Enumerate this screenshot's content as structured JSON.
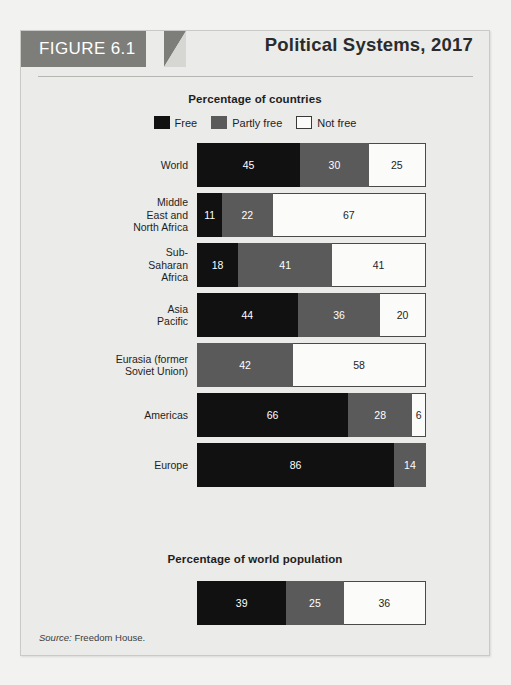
{
  "figure": {
    "tag": "FIGURE 6.1",
    "title": "Political Systems, 2017",
    "source_label": "Source:",
    "source_text": " Freedom House."
  },
  "legend": {
    "items": [
      {
        "label": "Free",
        "color": "#111111"
      },
      {
        "label": "Partly free",
        "color": "#5a5a5a"
      },
      {
        "label": "Not free",
        "color": "#ffffff"
      }
    ]
  },
  "chart_data": [
    {
      "type": "bar",
      "title": "Percentage of countries",
      "orientation": "horizontal",
      "stacked": true,
      "xlabel": "",
      "ylabel": "",
      "xlim": [
        0,
        100
      ],
      "grid": false,
      "legend_position": "top",
      "categories": [
        "World",
        "Middle\nEast and\nNorth Africa",
        "Sub-\nSaharan\nAfrica",
        "Asia\nPacific",
        "Eurasia (former\nSoviet Union)",
        "Americas",
        "Europe"
      ],
      "series": [
        {
          "name": "Free",
          "color": "#111111",
          "values": [
            45,
            11,
            18,
            44,
            0,
            66,
            86
          ]
        },
        {
          "name": "Partly free",
          "color": "#5a5a5a",
          "values": [
            30,
            22,
            41,
            36,
            42,
            28,
            14
          ]
        },
        {
          "name": "Not free",
          "color": "#ffffff",
          "values": [
            25,
            67,
            41,
            20,
            58,
            6,
            0
          ]
        }
      ]
    },
    {
      "type": "bar",
      "title": "Percentage of world population",
      "orientation": "horizontal",
      "stacked": true,
      "xlabel": "",
      "ylabel": "",
      "xlim": [
        0,
        100
      ],
      "grid": false,
      "legend_position": "none",
      "categories": [
        ""
      ],
      "series": [
        {
          "name": "Free",
          "color": "#111111",
          "values": [
            39
          ]
        },
        {
          "name": "Partly free",
          "color": "#5a5a5a",
          "values": [
            25
          ]
        },
        {
          "name": "Not free",
          "color": "#ffffff",
          "values": [
            36
          ]
        }
      ]
    }
  ]
}
